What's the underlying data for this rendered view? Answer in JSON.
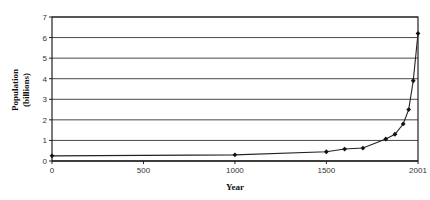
{
  "chart_data": {
    "type": "line",
    "title": "",
    "xlabel": "Year",
    "ylabel_lines": [
      "Population",
      "(billions)"
    ],
    "ylabel": "Population (billions)",
    "x": [
      0,
      1000,
      1500,
      1600,
      1700,
      1825,
      1875,
      1920,
      1950,
      1975,
      2001
    ],
    "values": [
      0.25,
      0.3,
      0.45,
      0.58,
      0.63,
      1.07,
      1.3,
      1.8,
      2.5,
      3.9,
      6.2
    ],
    "xlim": [
      0,
      2001
    ],
    "ylim": [
      0,
      7
    ],
    "x_ticks": [
      0,
      500,
      1000,
      1500,
      2001
    ],
    "y_ticks": [
      0,
      1,
      2,
      3,
      4,
      5,
      6,
      7
    ],
    "grid": "horizontal",
    "legend": null,
    "marker": "diamond",
    "colors": {
      "line": "#222222",
      "grid": "#333333",
      "axis": "#111111"
    }
  }
}
